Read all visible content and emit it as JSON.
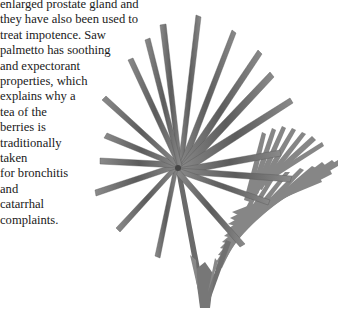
{
  "article": {
    "lines": [
      "enlarged prostate gland and",
      "they have also been used to",
      "treat impotence. Saw",
      "palmetto has soothing",
      "and expectorant",
      "properties, which",
      "explains why a",
      "tea of the",
      "berries is",
      "traditionally",
      "taken",
      "for bronchitis",
      "and",
      "catarrhal",
      "complaints."
    ]
  },
  "illustration": {
    "subject": "saw palmetto frond",
    "leaf_color": "#6e6e6e",
    "leaf_dark": "#4a4a4a",
    "leaf_light": "#9a9a9a"
  }
}
